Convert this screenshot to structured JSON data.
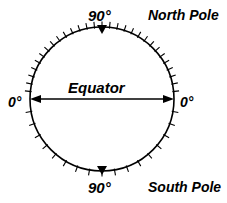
{
  "figure": {
    "type": "latitude-reference-circle",
    "background_color": "#ffffff",
    "stroke_color": "#000000"
  },
  "labels": {
    "north_degrees": "90°",
    "south_degrees": "90°",
    "north_pole": "North Pole",
    "south_pole": "South Pole",
    "left_degrees": "0°",
    "right_degrees": "0°",
    "equator": "Equator"
  },
  "chart_data": {
    "type": "diagram",
    "title": "",
    "circle": {
      "cx": 102,
      "cy": 99,
      "r": 72
    },
    "annotations": [
      {
        "name": "north-pole-marker",
        "position": "top",
        "value": "90°",
        "marker": "filled-triangle-down"
      },
      {
        "name": "south-pole-marker",
        "position": "bottom",
        "value": "90°",
        "marker": "filled-triangle-down"
      },
      {
        "name": "equator-left",
        "position": "left",
        "value": "0°"
      },
      {
        "name": "equator-right",
        "position": "right",
        "value": "0°"
      },
      {
        "name": "equator-axis",
        "position": "center",
        "value": "Equator",
        "marker": "double-headed-arrow"
      }
    ],
    "ticks": {
      "upper_half_step_degrees": 6,
      "lower_half_step_degrees": 10,
      "direction": "outward"
    }
  }
}
